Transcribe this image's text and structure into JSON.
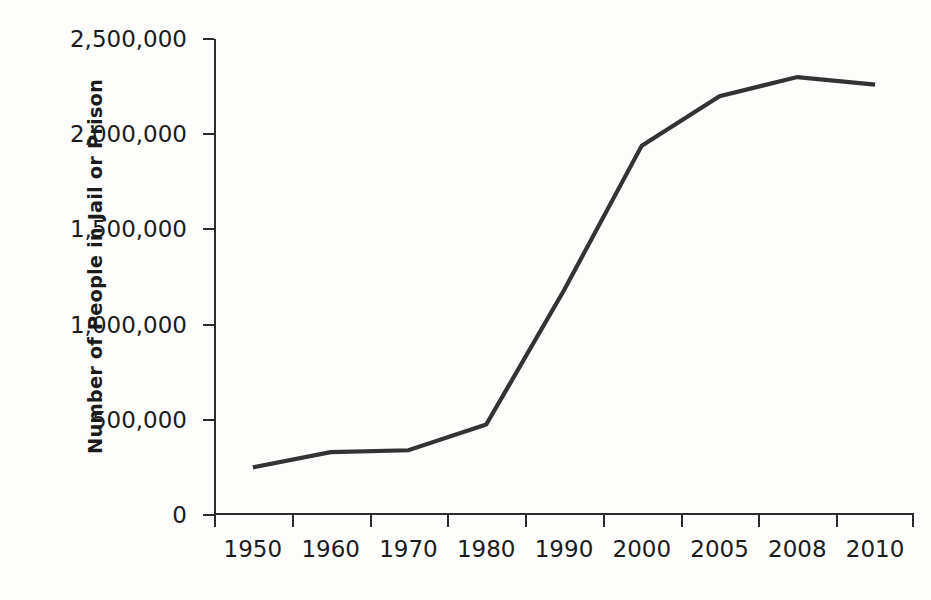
{
  "chart_data": {
    "type": "line",
    "title": "",
    "xlabel": "",
    "ylabel": "Number of People in Jail or Prison",
    "categories": [
      "1950",
      "1960",
      "1970",
      "1980",
      "1990",
      "2000",
      "2005",
      "2008",
      "2010"
    ],
    "values": [
      250000,
      330000,
      340000,
      475000,
      1180000,
      1940000,
      2200000,
      2300000,
      2260000
    ],
    "series": [
      {
        "name": "Number of People in Jail or Prison",
        "values": [
          250000,
          330000,
          340000,
          475000,
          1180000,
          1940000,
          2200000,
          2300000,
          2260000
        ]
      }
    ],
    "ylim": [
      0,
      2500000
    ],
    "ytick_values": [
      0,
      500000,
      1000000,
      1500000,
      2000000,
      2500000
    ],
    "ytick_labels": [
      "0",
      "500,000",
      "1,000,000",
      "1,500,000",
      "2,000,000",
      "2,500,000"
    ],
    "xtick_labels": [
      "1950",
      "1960",
      "1970",
      "1980",
      "1990",
      "2000",
      "2005",
      "2008",
      "2010"
    ],
    "grid": false,
    "legend": "none",
    "line_color": "#333333",
    "text_color": "#1b1b1b",
    "background_color": "#fdfdfc"
  }
}
